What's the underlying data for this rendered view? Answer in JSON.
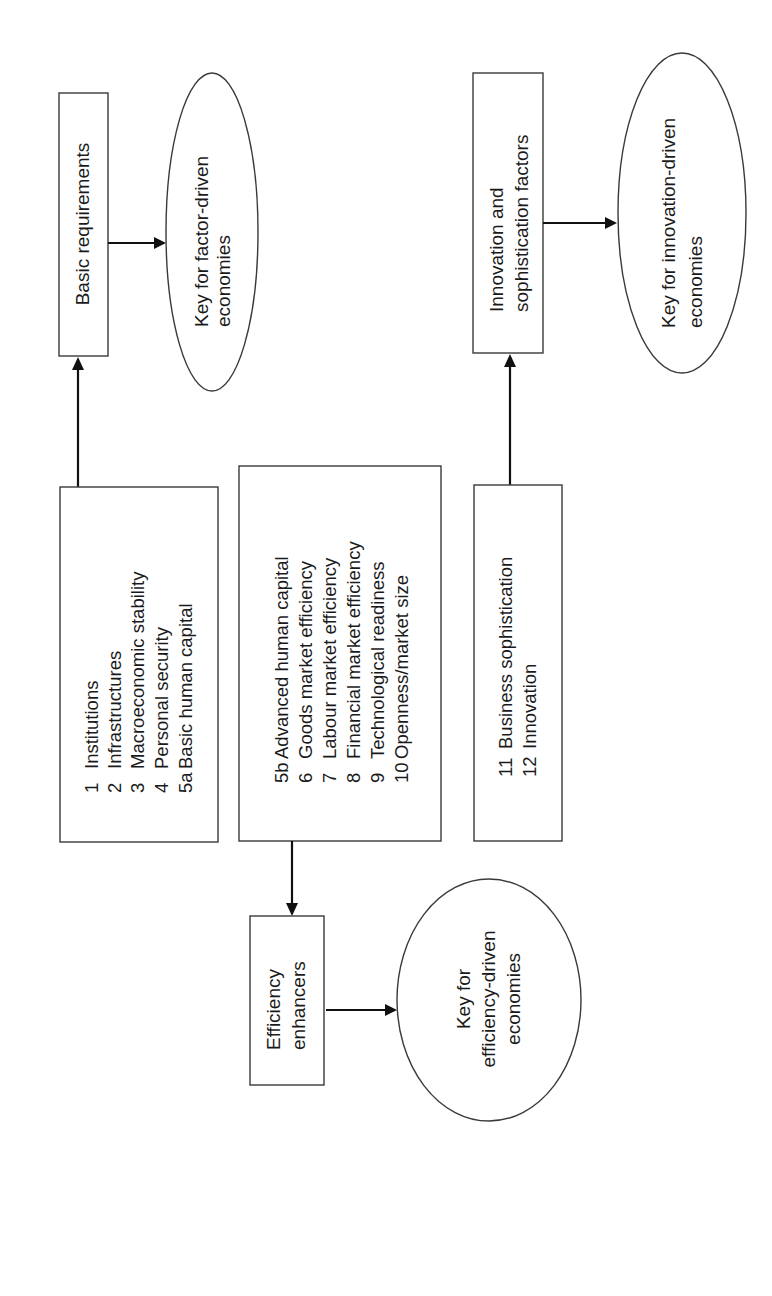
{
  "diagram": {
    "type": "flowchart",
    "orientation": "rotated-90-ccw",
    "pillar_groups": [
      {
        "id": "basic",
        "items": [
          {
            "num": "1",
            "label": "Institutions"
          },
          {
            "num": "2",
            "label": "Infrastructures"
          },
          {
            "num": "3",
            "label": "Macroeconomic stability"
          },
          {
            "num": "4",
            "label": "Personal security"
          },
          {
            "num": "5a",
            "label": "Basic human capital"
          }
        ],
        "category": {
          "lines": [
            "Basic requirements"
          ]
        },
        "outcome": {
          "lines": [
            "Key for factor-driven",
            "economies"
          ]
        }
      },
      {
        "id": "efficiency",
        "items": [
          {
            "num": "5b",
            "label": "Advanced human capital"
          },
          {
            "num": "6",
            "label": "Goods market efficiency"
          },
          {
            "num": "7",
            "label": "Labour market efficiency"
          },
          {
            "num": "8",
            "label": "Financial market efficiency"
          },
          {
            "num": "9",
            "label": "Technological readiness"
          },
          {
            "num": "10",
            "label": "Openness/market size"
          }
        ],
        "category": {
          "lines": [
            "Efficiency",
            "enhancers"
          ]
        },
        "outcome": {
          "lines": [
            "Key for",
            "efficiency-driven",
            "economies"
          ]
        }
      },
      {
        "id": "innovation",
        "items": [
          {
            "num": "11",
            "label": "Business sophistication"
          },
          {
            "num": "12",
            "label": "Innovation"
          }
        ],
        "category": {
          "lines": [
            "Innovation and",
            "sophistication factors"
          ]
        },
        "outcome": {
          "lines": [
            "Key for innovation-driven",
            "economies"
          ]
        }
      }
    ],
    "colors": {
      "stroke": "#3a3a3a",
      "arrow": "#111111",
      "background": "#ffffff"
    }
  }
}
